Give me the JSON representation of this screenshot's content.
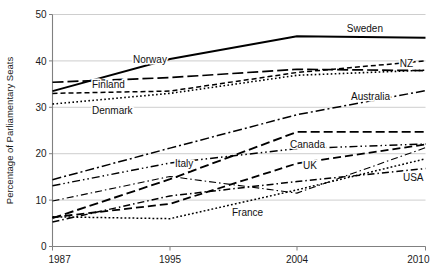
{
  "chart_data": {
    "type": "line",
    "title": "",
    "xlabel": "",
    "ylabel": "Percentage of Parliamentary Seats",
    "xlim": [
      1987,
      2010
    ],
    "ylim": [
      0,
      50
    ],
    "x_ticks": [
      1987,
      1995,
      2004,
      2010
    ],
    "y_ticks": [
      0,
      10,
      20,
      30,
      40,
      50
    ],
    "grid": "horizontal",
    "legend": "inline-labels-at-series",
    "x": [
      1987,
      1995,
      2004,
      2010
    ],
    "series": [
      {
        "name": "Sweden",
        "label": "Sweden",
        "values": [
          33.5,
          40.4,
          45.3,
          45.0
        ],
        "style": "solid",
        "width": 1.9,
        "dash": "none",
        "label_x": 383,
        "label_y": 32
      },
      {
        "name": "Norway",
        "label": "Norway",
        "values": [
          35.4,
          36.4,
          38.2,
          37.9
        ],
        "style": "long-dash",
        "width": 1.7,
        "dash": "11,4",
        "label_x": 133,
        "label_y": 63
      },
      {
        "name": "Finland",
        "label": "Finland",
        "values": [
          33.0,
          33.5,
          37.5,
          40.0
        ],
        "style": "short-dash",
        "width": 1.5,
        "dash": "5,3",
        "label_x": 92,
        "label_y": 88
      },
      {
        "name": "Denmark",
        "label": "Denmark",
        "values": [
          30.7,
          33.0,
          36.9,
          38.0
        ],
        "style": "dotted",
        "width": 1.6,
        "dash": "1.6,2.4",
        "label_x": 92,
        "label_y": 114
      },
      {
        "name": "NZ",
        "label": "NZ",
        "values": [
          14.4,
          21.2,
          28.4,
          33.6
        ],
        "style": "dash-dot",
        "width": 1.5,
        "dash": "9,3,2,3",
        "label_x": 413,
        "label_y": 67
      },
      {
        "name": "Australia",
        "label": "Australia",
        "values": [
          6.1,
          14.5,
          24.7,
          24.7
        ],
        "style": "long-dash-bold",
        "width": 1.9,
        "dash": "9,4",
        "label_x": 390,
        "label_y": 100
      },
      {
        "name": "Canada",
        "label": "Canada",
        "values": [
          13.1,
          18.0,
          21.1,
          22.1
        ],
        "style": "dash-dot-dot",
        "width": 1.4,
        "dash": "8,3,1.5,3,1.5,3",
        "label_x": 290,
        "label_y": 148
      },
      {
        "name": "Italy",
        "label": "Italy",
        "values": [
          9.8,
          15.1,
          11.5,
          21.3
        ],
        "style": "thin-dash-dot",
        "width": 1.1,
        "dash": "7,3,1.5,3",
        "label_x": 175,
        "label_y": 167
      },
      {
        "name": "UK",
        "label": "UK",
        "values": [
          6.3,
          9.2,
          17.9,
          22.0
        ],
        "style": "medium-dash",
        "width": 1.8,
        "dash": "8,4",
        "label_x": 303,
        "label_y": 169
      },
      {
        "name": "USA",
        "label": "USA",
        "values": [
          5.3,
          10.9,
          14.0,
          16.8
        ],
        "style": "dash-dot-thin",
        "width": 1.5,
        "dash": "7,3,1.5,3"
      },
      {
        "name": "France",
        "label": "France",
        "values": [
          6.4,
          6.0,
          12.2,
          18.9
        ],
        "style": "fine-dotted",
        "width": 1.5,
        "dash": "1.8,2.2",
        "label_x": 232,
        "label_y": 216
      }
    ],
    "colors": {
      "line": "#000000",
      "grid": "#b9b9b9",
      "axis": "#808080",
      "text": "#1a1a1a",
      "background": "#ffffff"
    }
  }
}
